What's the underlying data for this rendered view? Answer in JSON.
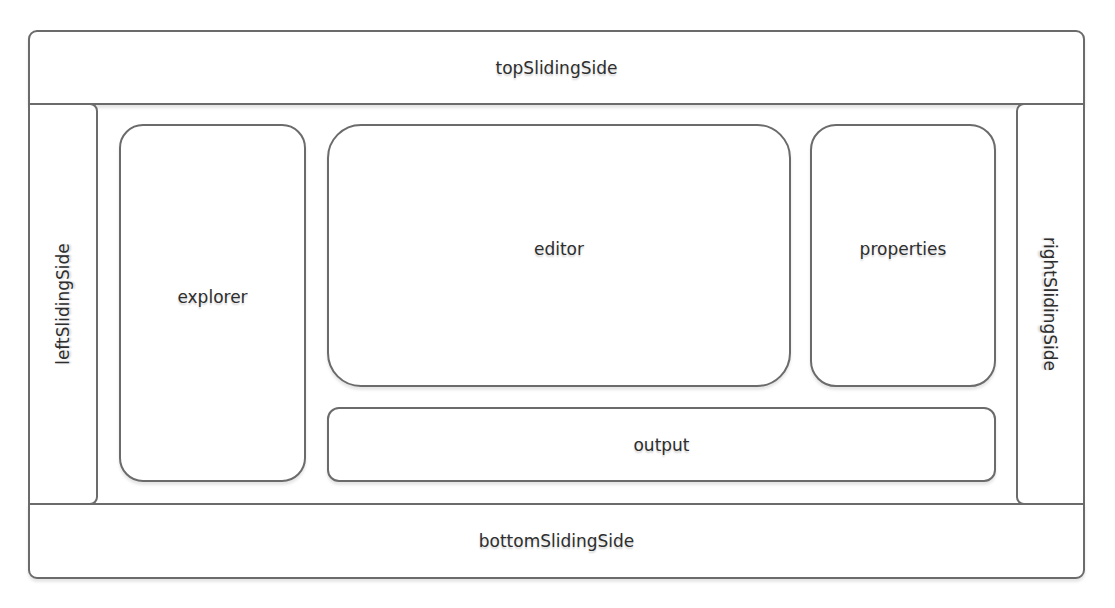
{
  "diagram": {
    "type": "layout-diagram",
    "regions": {
      "top": {
        "label": "topSlidingSide"
      },
      "bottom": {
        "label": "bottomSlidingSide"
      },
      "left": {
        "label": "leftSlidingSide"
      },
      "right": {
        "label": "rightSlidingSide"
      }
    },
    "panels": {
      "explorer": {
        "label": "explorer"
      },
      "editor": {
        "label": "editor"
      },
      "properties": {
        "label": "properties"
      },
      "output": {
        "label": "output"
      }
    },
    "colors": {
      "border": "#6b6b6b",
      "background": "#ffffff",
      "text": "#2e2e2e"
    }
  }
}
